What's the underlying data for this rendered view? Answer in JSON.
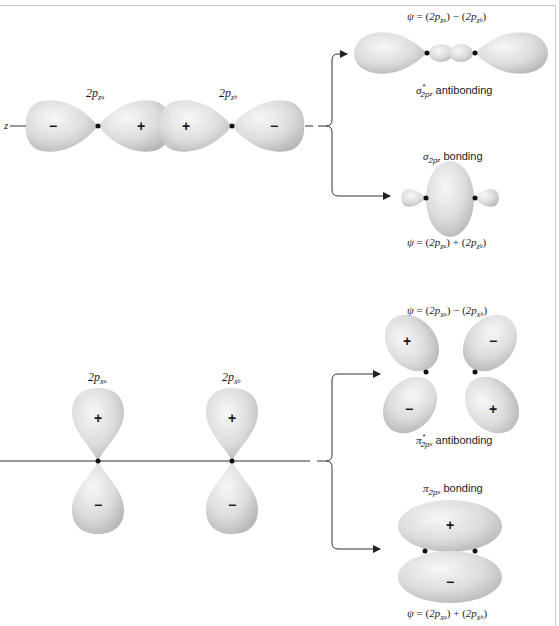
{
  "top_section": {
    "axis_label": "z",
    "orbital_a": {
      "prefix": "2p",
      "sub": "z",
      "subsub": "a"
    },
    "orbital_b": {
      "prefix": "2p",
      "sub": "z",
      "subsub": "b"
    },
    "signs": [
      "−",
      "+",
      "+",
      "−"
    ],
    "antibonding": {
      "equation": {
        "psi": "ψ",
        "eq": " = (",
        "p1": "2p",
        "s1": "z",
        "ss1": "a",
        "mid": ") − (",
        "p2": "2p",
        "s2": "z",
        "ss2": "b",
        "end": ")"
      },
      "symbol": "σ",
      "sub": "2p",
      "subsub": "z",
      "sup": "*",
      "text": " antibonding"
    },
    "bonding": {
      "symbol": "σ",
      "sub": "2p",
      "subsub": "z",
      "text": " bonding",
      "equation": {
        "psi": "ψ",
        "eq": " = (",
        "p1": "2p",
        "s1": "z",
        "ss1": "a",
        "mid": ") + (",
        "p2": "2p",
        "s2": "z",
        "ss2": "b",
        "end": ")"
      }
    }
  },
  "bottom_section": {
    "orbital_a": {
      "prefix": "2p",
      "sub": "x",
      "subsub": "a"
    },
    "orbital_b": {
      "prefix": "2p",
      "sub": "x",
      "subsub": "b"
    },
    "signs": [
      "+",
      "−",
      "+",
      "−"
    ],
    "antibonding": {
      "equation": {
        "psi": "ψ",
        "eq": " = (",
        "p1": "2p",
        "s1": "x",
        "ss1": "a",
        "mid": ") − (",
        "p2": "2p",
        "s2": "x",
        "ss2": "b",
        "end": ")"
      },
      "symbol": "π",
      "sub": "2p",
      "subsub": "x",
      "sup": "*",
      "text": " antibonding",
      "lobe_signs": [
        "+",
        "−",
        "−",
        "+"
      ]
    },
    "bonding": {
      "symbol": "π",
      "sub": "2p",
      "subsub": "x",
      "text": " bonding",
      "equation": {
        "psi": "ψ",
        "eq": " = (",
        "p1": "2p",
        "s1": "x",
        "ss1": "a",
        "mid": ") + (",
        "p2": "2p",
        "s2": "x",
        "ss2": "b",
        "end": ")"
      },
      "lobe_signs": [
        "+",
        "−"
      ]
    }
  },
  "colors": {
    "lobe_light": "#f2f2f2",
    "lobe_dark": "#bdbdbd",
    "line": "#333333",
    "frame": "#c8c8c8"
  }
}
